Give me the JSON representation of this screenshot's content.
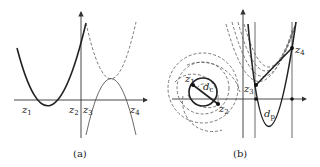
{
  "figure": {
    "panels": [
      {
        "id": "a",
        "caption": "(a)",
        "labels": [
          {
            "name": "z1",
            "base": "z",
            "sub": "1"
          },
          {
            "name": "z2",
            "base": "z",
            "sub": "2"
          },
          {
            "name": "z3",
            "base": "z",
            "sub": "3"
          },
          {
            "name": "z4",
            "base": "z",
            "sub": "4"
          }
        ]
      },
      {
        "id": "b",
        "caption": "(b)",
        "labels": [
          {
            "name": "z1",
            "base": "z",
            "sub": "1"
          },
          {
            "name": "z2",
            "base": "z",
            "sub": "2"
          },
          {
            "name": "z3",
            "base": "z",
            "sub": "3"
          },
          {
            "name": "z4",
            "base": "z",
            "sub": "4"
          },
          {
            "name": "dc",
            "base": "d",
            "sub": "c"
          },
          {
            "name": "dp",
            "base": "d",
            "sub": "p"
          }
        ]
      }
    ]
  }
}
